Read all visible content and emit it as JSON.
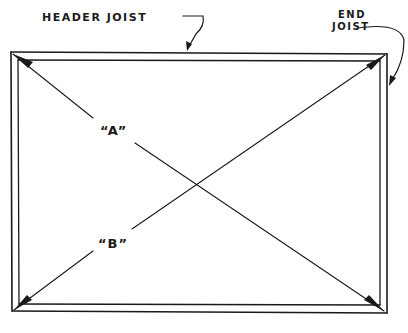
{
  "diagram": {
    "labels": {
      "header_joist": "HEADER JOIST",
      "end_joist_line1": "END",
      "end_joist_line2": "JOIST",
      "diagonal_a": "“A”",
      "diagonal_b": "“B”"
    },
    "colors": {
      "ink": "#1a1a1a",
      "background": "#ffffff"
    }
  }
}
